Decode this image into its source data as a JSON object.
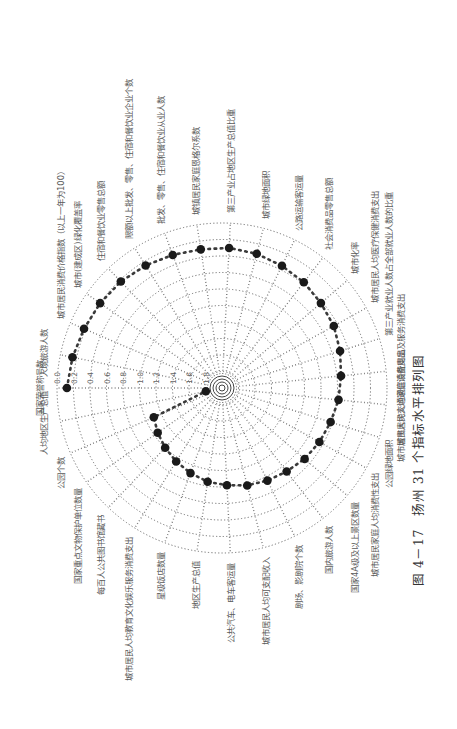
{
  "page": {
    "rotation_deg": -90,
    "caption": "图 4－17　扬州 31 个指标水平排列图"
  },
  "chart_data": {
    "type": "radar",
    "title": "扬州 31 个指标水平排列图",
    "figure_number": "图 4－17",
    "scale": {
      "ticks": [
        "0.0",
        "0.2",
        "0.4",
        "0.6",
        "0.8",
        "1.0",
        "1.2",
        "1.4",
        "1.6",
        "1.8"
      ],
      "range": [
        0.0,
        1.8
      ],
      "direction": "outer edge = 0.0, increasing toward center",
      "grid": "dotted concentric rings and dotted radial spokes"
    },
    "categories": [
      "国家荣誉称号数",
      "人境旅游人数",
      "城市居民消费价格指数（以上一年为100）",
      "城市(建成区)绿化覆盖率",
      "住宿和餐饮业零售总额",
      "限额以上批发、零售、住宿和餐饮业企业个数",
      "批发、零售、住宿和餐饮业从业人数",
      "城镇居民家庭恩格尔系数",
      "第三产业占地区生产总值比重",
      "城市绿地面积",
      "公路运输客运量",
      "社会消费品零售总额",
      "城市化率",
      "城市居民人均医疗保健消费支出",
      "第三产业就业人数占全部就业人数的比重",
      "城市居民人均家庭设备用品及服务消费支出",
      "城市居民人均交通通信消费支出",
      "公园绿地面积",
      "城市居民家庭人均消费性支出",
      "国家4A级及以上景区数量",
      "国内旅游人数",
      "剧场、影剧院个数",
      "城市居民人均可支配收入",
      "公共汽车、电车客运量",
      "地区生产总值",
      "星级饭店数量",
      "城市居民人均教育文化娱乐服务消费支出",
      "每百人公共图书馆藏书",
      "国家重点文物保护单位数量",
      "公园个数",
      "人均地区生产总值"
    ],
    "series": [
      {
        "name": "扬州",
        "values": [
          0.12,
          0.15,
          0.18,
          0.2,
          0.22,
          0.25,
          0.28,
          0.3,
          0.3,
          0.32,
          0.35,
          0.38,
          0.42,
          0.45,
          0.5,
          0.55,
          0.58,
          0.62,
          0.65,
          0.68,
          0.72,
          0.75,
          0.78,
          0.82,
          0.85,
          0.9,
          0.95,
          1.0,
          1.05,
          1.1,
          1.8
        ]
      }
    ],
    "legend": "none"
  },
  "labels": {
    "ticks": [
      "0.0",
      "0.2",
      "0.4",
      "0.6",
      "0.8",
      "1.0",
      "1.2",
      "1.4",
      "1.6",
      "1.8"
    ]
  }
}
